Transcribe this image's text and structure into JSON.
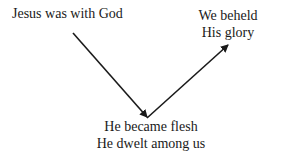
{
  "diagram": {
    "nodes": [
      {
        "id": "start",
        "lines": [
          "Jesus was with God"
        ]
      },
      {
        "id": "bottom",
        "lines": [
          "He became flesh",
          "He dwelt among us"
        ]
      },
      {
        "id": "end",
        "lines": [
          "We beheld",
          "His glory"
        ]
      }
    ],
    "edges": [
      {
        "from": "start",
        "to": "bottom",
        "type": "arrow"
      },
      {
        "from": "bottom",
        "to": "end",
        "type": "arrow"
      }
    ],
    "colors": {
      "line": "#1a1a1a",
      "background": "#ffffff"
    }
  }
}
